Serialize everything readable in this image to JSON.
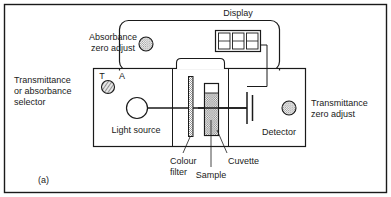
{
  "figure": {
    "caption": "(a)",
    "border_color": "#1a1a1a",
    "background": "#ffffff",
    "ink_color": "#1a1a1a"
  },
  "labels": {
    "display": "Display",
    "absorbance_zero_adjust": "Absorbance\nzero adjust",
    "absorbance_zero_adjust_line1": "Absorbance",
    "absorbance_zero_adjust_line2": "zero adjust",
    "selector_line1": "Transmittance",
    "selector_line2": "or absorbance",
    "selector_line3": "selector",
    "transmittance_zero_adjust_line1": "Transmittance",
    "transmittance_zero_adjust_line2": "zero adjust",
    "light_source": "Light source",
    "detector": "Detector",
    "colour_filter_line1": "Colour",
    "colour_filter_line2": "filter",
    "sample": "Sample",
    "cuvette": "Cuvette",
    "selector_mark_t": "T",
    "selector_mark_a": "A"
  },
  "components": {
    "display_digit_count": 3,
    "display_digits": [
      "",
      "",
      ""
    ],
    "knobs": [
      {
        "name": "absorbance-zero-adjust-knob",
        "texture": "stipple"
      },
      {
        "name": "transmittance-or-absorbance-selector-knob",
        "texture": "diagonal-hatch"
      },
      {
        "name": "transmittance-zero-adjust-knob",
        "texture": "stipple"
      }
    ],
    "light_source_shape": "circle",
    "colour_filter_shape": "thin-vertical-bar",
    "cuvette_shape": "tall-rectangle",
    "sample_fill": "stipple",
    "detector_shape": "capacitor-symbol"
  },
  "colors": {
    "ink": "#1a1a1a",
    "paper": "#ffffff",
    "knob_fill": "#c9c9c9",
    "sample_fill": "#d6d6d6",
    "filter_fill": "#bfbfbf"
  }
}
